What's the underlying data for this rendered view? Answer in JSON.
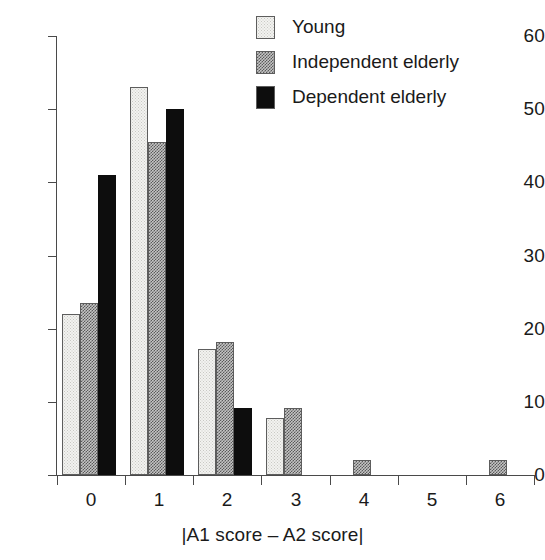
{
  "chart_data": {
    "type": "bar",
    "title": "",
    "subtitle": "",
    "xlabel": "|A1 score – A2 score|",
    "ylabel": "",
    "categories": [
      "0",
      "1",
      "2",
      "3",
      "4",
      "5",
      "6"
    ],
    "ylim": [
      0,
      60
    ],
    "yticks": [
      0,
      10,
      20,
      30,
      40,
      50,
      60
    ],
    "ytick_labels": [
      "0",
      "10",
      "20",
      "30",
      "40",
      "50",
      "60"
    ],
    "grid": false,
    "legend_position": "top-right",
    "series": [
      {
        "name": "Young",
        "fill": "light-dotted",
        "color": "#f2f2f0",
        "values": [
          22,
          53,
          17.2,
          7.8,
          0,
          0,
          0
        ]
      },
      {
        "name": "Independent elderly",
        "fill": "gray-checkered",
        "color": "#8a8a8a",
        "values": [
          23.5,
          45.5,
          18.2,
          9.2,
          2,
          0,
          2
        ]
      },
      {
        "name": "Dependent elderly",
        "fill": "solid-black",
        "color": "#0d0d0d",
        "values": [
          41,
          50,
          9.2,
          0,
          0,
          0,
          0
        ]
      }
    ]
  },
  "axes": {
    "y_tick_labels": [
      "60",
      "50",
      "40",
      "30",
      "20",
      "10",
      "0"
    ],
    "x_tick_labels": [
      "0",
      "1",
      "2",
      "3",
      "4",
      "5",
      "6"
    ],
    "x_axis_title": "|A1 score – A2 score|"
  },
  "legend": {
    "items": [
      {
        "label": "Young"
      },
      {
        "label": "Independent elderly"
      },
      {
        "label": "Dependent elderly"
      }
    ]
  }
}
